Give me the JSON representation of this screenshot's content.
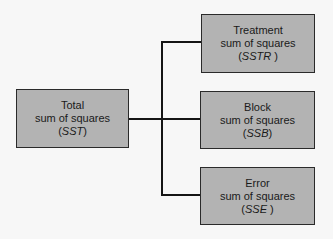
{
  "diagram": {
    "root": {
      "title": "Total",
      "subtitle": "sum of squares",
      "abbr_open": "(",
      "abbr": "SST",
      "abbr_close": ")"
    },
    "children": [
      {
        "title": "Treatment",
        "subtitle": "sum of squares",
        "abbr_open": "(",
        "abbr": "SSTR",
        "abbr_close": " )"
      },
      {
        "title": "Block",
        "subtitle": "sum of squares",
        "abbr_open": "(",
        "abbr": "SSB",
        "abbr_close": ")"
      },
      {
        "title": "Error",
        "subtitle": "sum of squares",
        "abbr_open": "(",
        "abbr": "SSE",
        "abbr_close": " )"
      }
    ],
    "colors": {
      "box_fill": "#b3b3b3",
      "line": "#151515",
      "background": "#f7f7f7"
    }
  }
}
